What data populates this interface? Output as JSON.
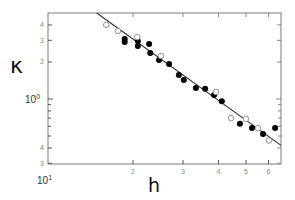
{
  "chart_data": {
    "type": "scatter",
    "title": "",
    "xlabel": "h",
    "ylabel": "κ",
    "xscale": "log",
    "yscale": "log",
    "xlim": [
      1.0,
      6.64
    ],
    "ylim": [
      0.3,
      5.0
    ],
    "grid": false,
    "legend": null,
    "x_ticks": [
      {
        "value": 1,
        "label": "10¹",
        "major": true
      },
      {
        "value": 2,
        "label": "2"
      },
      {
        "value": 3,
        "label": "3"
      },
      {
        "value": 4,
        "label": "4"
      },
      {
        "value": 5,
        "label": "5"
      },
      {
        "value": 6,
        "label": "6"
      }
    ],
    "y_ticks": [
      {
        "value": 0.3,
        "label": "3"
      },
      {
        "value": 0.4,
        "label": "4"
      },
      {
        "value": 0.5,
        "label": ""
      },
      {
        "value": 0.6,
        "label": ""
      },
      {
        "value": 0.7,
        "label": ""
      },
      {
        "value": 0.8,
        "label": ""
      },
      {
        "value": 0.9,
        "label": ""
      },
      {
        "value": 1.0,
        "label": "10⁰",
        "major": true
      },
      {
        "value": 2,
        "label": "2"
      },
      {
        "value": 3,
        "label": "3"
      },
      {
        "value": 4,
        "label": "4"
      }
    ],
    "series": [
      {
        "name": "filled",
        "marker": "filled-circle",
        "color": "#000000",
        "points": [
          [
            1.87,
            3.07
          ],
          [
            1.87,
            2.91
          ],
          [
            2.08,
            2.96
          ],
          [
            2.08,
            2.7
          ],
          [
            2.28,
            2.8
          ],
          [
            2.3,
            2.37
          ],
          [
            2.47,
            2.08
          ],
          [
            2.68,
            1.93
          ],
          [
            2.9,
            1.57
          ],
          [
            3.02,
            1.43
          ],
          [
            3.33,
            1.23
          ],
          [
            3.59,
            1.21
          ],
          [
            3.86,
            1.08
          ],
          [
            4.11,
            0.96
          ],
          [
            4.76,
            0.63
          ],
          [
            5.25,
            0.58
          ],
          [
            5.74,
            0.52
          ],
          [
            6.33,
            0.58
          ]
        ]
      },
      {
        "name": "open",
        "marker": "open-circle",
        "color": "#888888",
        "points": [
          [
            1.61,
            4.0
          ],
          [
            1.77,
            3.57
          ],
          [
            2.07,
            3.19
          ],
          [
            2.51,
            2.24
          ],
          [
            3.92,
            1.14
          ],
          [
            4.43,
            0.7
          ],
          [
            5.0,
            0.69
          ],
          [
            5.51,
            0.58
          ],
          [
            6.02,
            0.46
          ]
        ]
      }
    ],
    "fit_line": {
      "type": "power-law",
      "color": "#333333",
      "points": [
        [
          1.49,
          5.0
        ],
        [
          6.64,
          0.42
        ]
      ]
    }
  },
  "labels": {
    "x_axis_title": "h",
    "y_axis_title": "κ",
    "x_decade": "10",
    "x_decade_exp": "1",
    "y_decade": "10",
    "y_decade_exp": "0"
  }
}
